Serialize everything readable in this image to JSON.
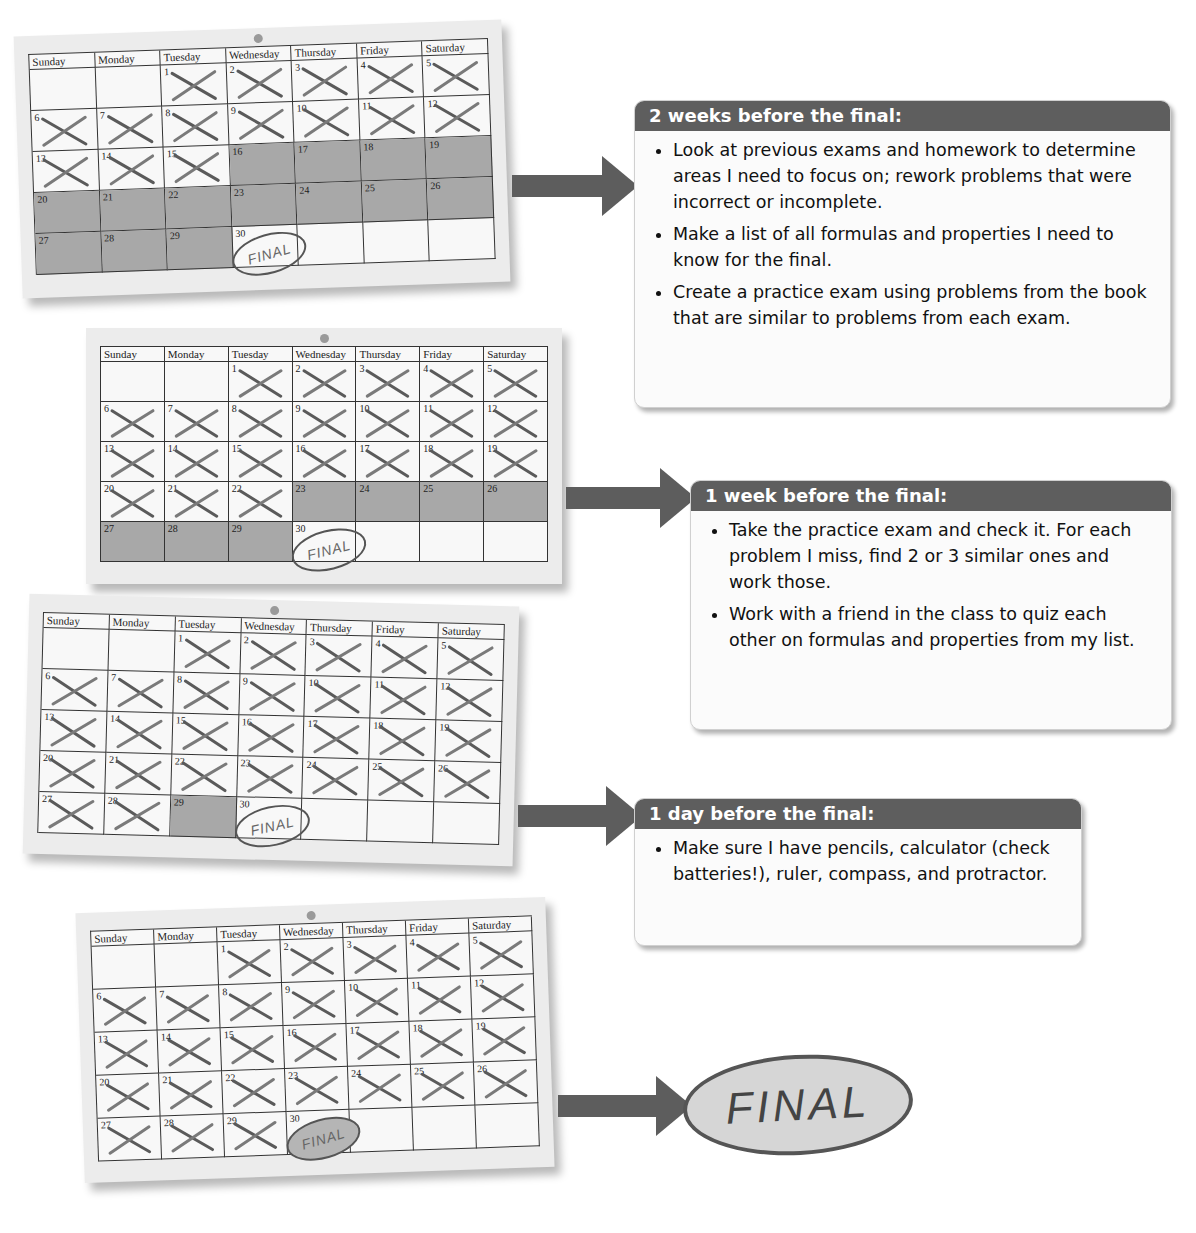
{
  "weekdays": [
    "Sunday",
    "Monday",
    "Tuesday",
    "Wednesday",
    "Thursday",
    "Friday",
    "Saturday"
  ],
  "month": {
    "first_weekday_index": 2,
    "days": 30,
    "final_day": 30,
    "final_label": "FINAL"
  },
  "calendars": [
    {
      "id": "two-weeks",
      "crossed_through": 15,
      "shaded_from": 16,
      "shaded_to": 29,
      "final_filled": false
    },
    {
      "id": "one-week",
      "crossed_through": 22,
      "shaded_from": 23,
      "shaded_to": 29,
      "final_filled": false
    },
    {
      "id": "one-day",
      "crossed_through": 28,
      "shaded_from": 29,
      "shaded_to": 29,
      "final_filled": false
    },
    {
      "id": "day-of",
      "crossed_through": 29,
      "shaded_from": 0,
      "shaded_to": -1,
      "final_filled": true
    }
  ],
  "notes": [
    {
      "title": "2 weeks before the final:",
      "items": [
        "Look at previous exams and homework to determine areas I need to focus on; rework problems that were incorrect or incomplete.",
        "Make a list of all formulas and properties I need to know for the final.",
        "Create a practice exam using problems from the book that are similar to problems from each exam."
      ]
    },
    {
      "title": "1 week before the final:",
      "items": [
        "Take the practice exam and check it. For each problem I miss, find 2 or 3 similar ones and work those.",
        "Work with a friend in the class to quiz each other on formulas and properties from my list."
      ]
    },
    {
      "title": "1 day before the final:",
      "items": [
        "Make sure I have pencils, calculator (check batteries!), ruler, compass, and protractor."
      ]
    }
  ],
  "final_oval_label": "FINAL",
  "colors": {
    "header_bar": "#5e5e5e",
    "arrow": "#5d5d5d",
    "shaded_day": "#a8a8a8",
    "calendar_bg": "#ececec"
  }
}
